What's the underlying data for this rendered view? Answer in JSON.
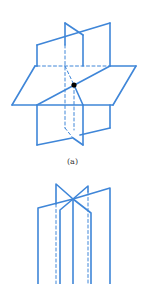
{
  "figures": [
    {
      "id": "a",
      "caption": "(a)",
      "description": "Three planes intersecting at a single point",
      "line_color": "#3f86d8",
      "point_color": "#000000"
    },
    {
      "id": "b",
      "caption": "",
      "description": "Three planes intersecting along a common line",
      "line_color": "#3f86d8"
    }
  ]
}
